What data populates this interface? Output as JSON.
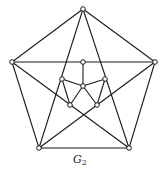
{
  "figure": {
    "label": "G",
    "label_subscript": "2",
    "vertices": [
      "top",
      "left",
      "right",
      "bottom_left",
      "bottom_right",
      "inner_top",
      "center",
      "inner_left",
      "inner_right",
      "inner_bottom_left",
      "inner_bottom_right"
    ],
    "edges": [
      [
        "top",
        "left"
      ],
      [
        "top",
        "right"
      ],
      [
        "left",
        "bottom_left"
      ],
      [
        "right",
        "bottom_right"
      ],
      [
        "bottom_left",
        "bottom_right"
      ],
      [
        "left",
        "right"
      ],
      [
        "top",
        "bottom_left"
      ],
      [
        "top",
        "bottom_right"
      ],
      [
        "left",
        "bottom_right"
      ],
      [
        "right",
        "bottom_left"
      ],
      [
        "inner_top",
        "center"
      ],
      [
        "center",
        "inner_left"
      ],
      [
        "center",
        "inner_right"
      ],
      [
        "center",
        "inner_bottom_left"
      ],
      [
        "center",
        "inner_bottom_right"
      ],
      [
        "inner_left",
        "inner_bottom_left"
      ],
      [
        "inner_right",
        "inner_bottom_right"
      ]
    ]
  }
}
